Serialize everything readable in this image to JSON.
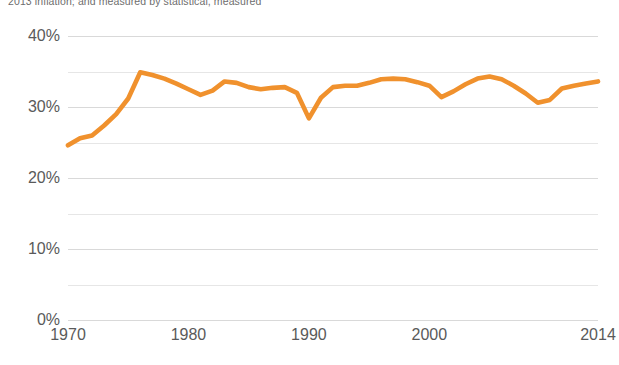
{
  "caption": {
    "text": "2013 inflation; and measured by statistical, measured"
  },
  "colors": {
    "series": "#F0912D",
    "gridline": "#d9d9d9",
    "gridline_minor": "#e6e6e6",
    "tick_text": "#5a5a5a",
    "background": "#ffffff"
  },
  "axes": {
    "y_ticks": [
      {
        "label": "40%",
        "value": 40
      },
      {
        "label": "30%",
        "value": 30
      },
      {
        "label": "20%",
        "value": 20
      },
      {
        "label": "10%",
        "value": 10
      },
      {
        "label": "0%",
        "value": 0
      }
    ],
    "y_minor_values": [
      35,
      25,
      15,
      5
    ],
    "x_ticks": [
      {
        "label": "1970",
        "value": 1970
      },
      {
        "label": "1980",
        "value": 1980
      },
      {
        "label": "1990",
        "value": 1990
      },
      {
        "label": "2000",
        "value": 2000
      },
      {
        "label": "2014",
        "value": 2014
      }
    ]
  },
  "chart_data": {
    "type": "line",
    "title": "",
    "subtitle": "2013 inflation; and measured by statistical, measured",
    "xlabel": "",
    "ylabel": "",
    "xlim": [
      1970,
      2014
    ],
    "ylim": [
      0,
      40
    ],
    "grid": true,
    "legend": "none",
    "y_tick_labels": [
      "0%",
      "10%",
      "20%",
      "30%",
      "40%"
    ],
    "x_tick_labels": [
      "1970",
      "1980",
      "1990",
      "2000",
      "2014"
    ],
    "x": [
      1970,
      1971,
      1972,
      1973,
      1974,
      1975,
      1976,
      1977,
      1978,
      1979,
      1980,
      1981,
      1982,
      1983,
      1984,
      1985,
      1986,
      1987,
      1988,
      1989,
      1990,
      1991,
      1992,
      1993,
      1994,
      1995,
      1996,
      1997,
      1998,
      1999,
      2000,
      2001,
      2002,
      2003,
      2004,
      2005,
      2006,
      2007,
      2008,
      2009,
      2010,
      2011,
      2012,
      2013,
      2014
    ],
    "values": [
      24.6,
      25.6,
      26.0,
      27.4,
      29.0,
      31.2,
      34.9,
      34.5,
      34.0,
      33.3,
      32.5,
      31.7,
      32.3,
      33.6,
      33.4,
      32.8,
      32.5,
      32.7,
      32.8,
      32.0,
      28.4,
      31.3,
      32.8,
      33.0,
      33.0,
      33.4,
      33.9,
      34.0,
      33.9,
      33.5,
      33.0,
      31.4,
      32.2,
      33.2,
      34.0,
      34.3,
      33.9,
      33.0,
      31.9,
      30.6,
      31.0,
      32.6,
      33.0,
      33.3,
      33.6
    ],
    "series": [
      {
        "name": "share",
        "color": "#F0912D",
        "values": [
          24.6,
          25.6,
          26.0,
          27.4,
          29.0,
          31.2,
          34.9,
          34.5,
          34.0,
          33.3,
          32.5,
          31.7,
          32.3,
          33.6,
          33.4,
          32.8,
          32.5,
          32.7,
          32.8,
          32.0,
          28.4,
          31.3,
          32.8,
          33.0,
          33.0,
          33.4,
          33.9,
          34.0,
          33.9,
          33.5,
          33.0,
          31.4,
          32.2,
          33.2,
          34.0,
          34.3,
          33.9,
          33.0,
          31.9,
          30.6,
          31.0,
          32.6,
          33.0,
          33.3,
          33.6
        ]
      }
    ]
  }
}
